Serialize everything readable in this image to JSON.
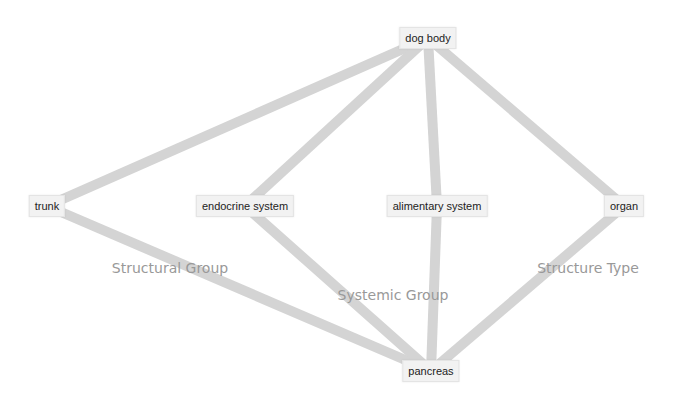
{
  "diagram": {
    "type": "graph",
    "edge_color": "#d4d4d4",
    "nodes": [
      {
        "id": "dog_body",
        "label": "dog body",
        "x": 428,
        "y": 38
      },
      {
        "id": "trunk",
        "label": "trunk",
        "x": 47,
        "y": 206
      },
      {
        "id": "endocrine_system",
        "label": "endocrine system",
        "x": 245,
        "y": 206
      },
      {
        "id": "alimentary_system",
        "label": "alimentary system",
        "x": 437,
        "y": 206
      },
      {
        "id": "organ",
        "label": "organ",
        "x": 624,
        "y": 206
      },
      {
        "id": "pancreas",
        "label": "pancreas",
        "x": 431,
        "y": 371
      }
    ],
    "edges": [
      {
        "from": "dog_body",
        "to": "trunk"
      },
      {
        "from": "dog_body",
        "to": "endocrine_system"
      },
      {
        "from": "dog_body",
        "to": "alimentary_system"
      },
      {
        "from": "dog_body",
        "to": "organ"
      },
      {
        "from": "trunk",
        "to": "pancreas"
      },
      {
        "from": "endocrine_system",
        "to": "pancreas"
      },
      {
        "from": "alimentary_system",
        "to": "pancreas"
      },
      {
        "from": "organ",
        "to": "pancreas"
      }
    ],
    "group_labels": [
      {
        "label": "Structural Group",
        "x": 170,
        "y": 268
      },
      {
        "label": "Systemic Group",
        "x": 393,
        "y": 295
      },
      {
        "label": "Structure Type",
        "x": 588,
        "y": 268
      }
    ]
  }
}
